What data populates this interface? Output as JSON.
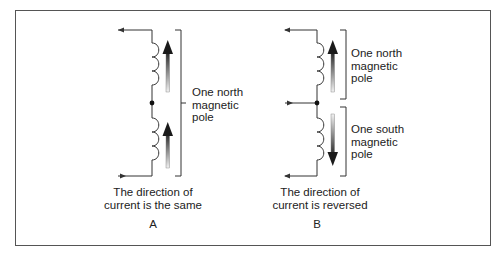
{
  "figure": {
    "panels": [
      {
        "id": "A",
        "letter": "A",
        "caption_line1": "The direction of",
        "caption_line2": "current is the same",
        "labels": [
          {
            "line1": "One north",
            "line2": "magnetic",
            "line3": "pole"
          }
        ]
      },
      {
        "id": "B",
        "letter": "B",
        "caption_line1": "The direction of",
        "caption_line2": "current is reversed",
        "labels": [
          {
            "line1": "One north",
            "line2": "magnetic",
            "line3": "pole"
          },
          {
            "line1": "One south",
            "line2": "magnetic",
            "line3": "pole"
          }
        ]
      }
    ],
    "colors": {
      "line": "#333333",
      "frame": "#555555",
      "arrow_dark": "#1a1a1a",
      "arrow_light": "#e8e8e8"
    }
  }
}
